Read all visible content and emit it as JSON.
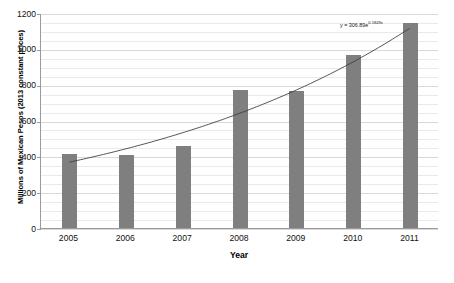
{
  "chart_data": {
    "type": "bar",
    "title": "",
    "xlabel": "Year",
    "ylabel": "Millions of Mexican Pesos (2013 constant prices)",
    "categories": [
      "2005",
      "2006",
      "2007",
      "2008",
      "2009",
      "2010",
      "2011"
    ],
    "values": [
      415,
      408,
      455,
      772,
      765,
      965,
      1145
    ],
    "ylim": [
      0,
      1200
    ],
    "y_ticks": [
      0,
      200,
      400,
      600,
      800,
      1000,
      1200
    ],
    "y_tick_labels": [
      "0",
      "200",
      "400",
      "600",
      "800",
      "1000",
      "1200"
    ],
    "y_minor_interval": 50,
    "grid": true,
    "legend": false,
    "bar_color": "#7f7f7f",
    "series": [
      {
        "name": "Millions of Mexican Pesos (2013 constant prices)",
        "values": [
          415,
          408,
          455,
          772,
          765,
          965,
          1145
        ]
      }
    ],
    "trendline": {
      "type": "exponential",
      "coefficient": 306.89,
      "exponent": 0.1849,
      "equation_prefix": "y = 306.89e",
      "equation_exponent": "0.1849x",
      "color": "#404040",
      "fitted_values": [
        369,
        444,
        534,
        643,
        774,
        931,
        1121
      ]
    }
  },
  "axes": {
    "y_title": "Millions of Mexican Pesos (2013 constant prices)",
    "x_title": "Year"
  }
}
